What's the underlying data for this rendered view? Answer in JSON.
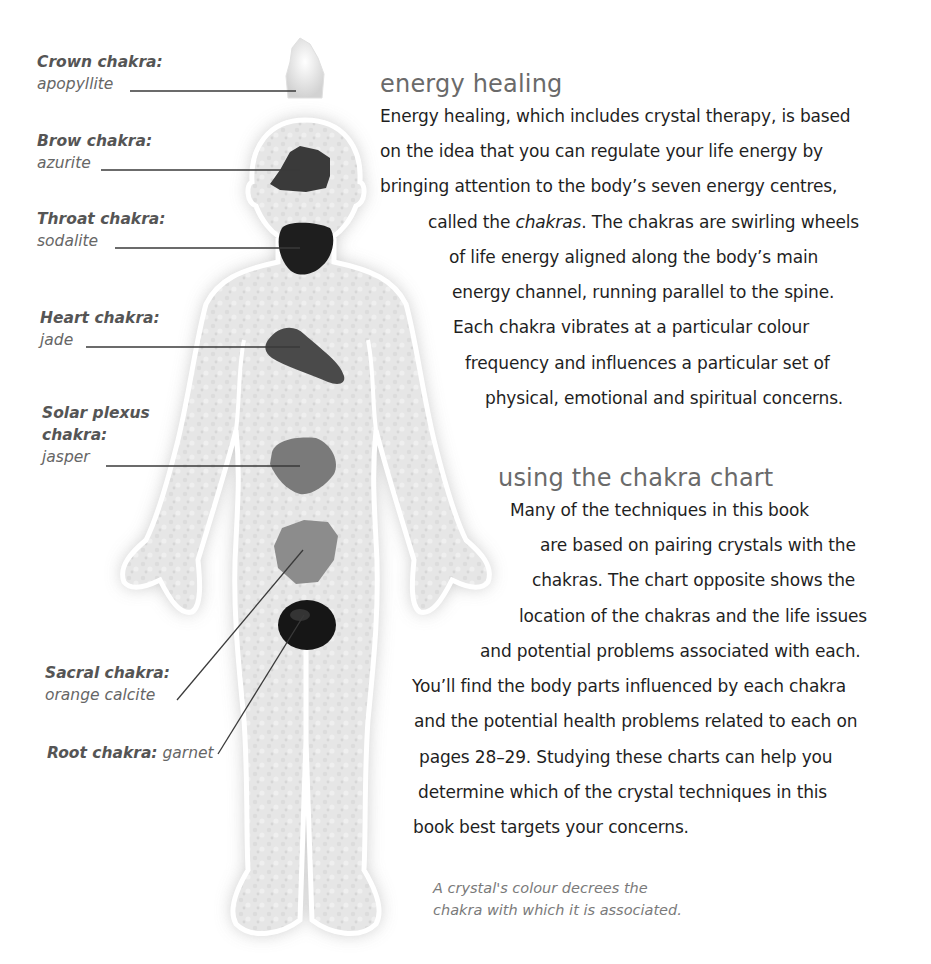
{
  "figure": {
    "chakras": [
      {
        "name": "Crown chakra:",
        "stone": "apopyllite",
        "shade": "#e8e8e8"
      },
      {
        "name": "Brow chakra:",
        "stone": "azurite",
        "shade": "#3a3a3a"
      },
      {
        "name": "Throat chakra:",
        "stone": "sodalite",
        "shade": "#1e1e1e"
      },
      {
        "name": "Heart chakra:",
        "stone": "jade",
        "shade": "#4a4a4a"
      },
      {
        "name": "Solar plexus chakra:",
        "name_line1": "Solar plexus",
        "name_line2": "chakra:",
        "stone": "jasper",
        "shade": "#7a7a7a"
      },
      {
        "name": "Sacral chakra:",
        "stone": "orange calcite",
        "shade": "#8c8c8c"
      },
      {
        "name": "Root chakra:",
        "stone": "garnet",
        "shade": "#161616"
      }
    ],
    "caption_line1": "A crystal's colour decrees the",
    "caption_line2": "chakra with which it is associated."
  },
  "sections": [
    {
      "heading": "energy healing",
      "lines": [
        "Energy healing, which includes crystal therapy, is based",
        "on the idea that you can regulate your life energy by",
        "bringing attention to the body’s seven energy centres,",
        "called the chakras. The chakras are swirling wheels",
        "of life energy aligned along the body’s main",
        "energy channel, running parallel to the spine.",
        "Each chakra vibrates at a particular colour",
        "frequency and influences a particular set of",
        "physical, emotional and spiritual concerns."
      ],
      "emphasis_word": "chakras"
    },
    {
      "heading": "using the chakra chart",
      "lines": [
        "Many of the techniques in this book",
        "are based on pairing crystals with the",
        "chakras. The chart opposite shows the",
        "location of the chakras and the life issues",
        "and potential problems associated with each.",
        "You’ll find the body parts influenced by each chakra",
        "and the potential health problems related to each on",
        "pages 28–29. Studying these charts can help you",
        "determine which of the crystal techniques in this",
        "book best targets your concerns."
      ]
    }
  ]
}
